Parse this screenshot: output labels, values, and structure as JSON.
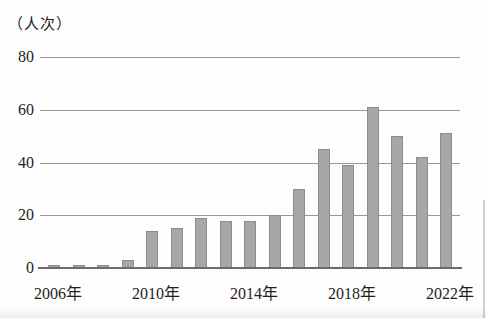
{
  "figure": {
    "unit_label": "（人次）"
  },
  "chart_data": {
    "type": "bar",
    "title": "",
    "xlabel": "",
    "ylabel": "（人次）",
    "x": [
      2006,
      2007,
      2008,
      2009,
      2010,
      2011,
      2012,
      2013,
      2014,
      2015,
      2016,
      2017,
      2018,
      2019,
      2020,
      2021,
      2022
    ],
    "values": [
      1,
      1,
      1,
      3,
      14,
      15,
      19,
      18,
      18,
      20,
      30,
      45,
      39,
      61,
      50,
      42,
      51
    ],
    "ylim": [
      0,
      80
    ],
    "yticks": [
      0,
      20,
      40,
      60,
      80
    ],
    "ytick_labels": [
      "0",
      "20",
      "40",
      "60",
      "80"
    ],
    "x_tick_labels": [
      {
        "index": 0,
        "label": "2006年"
      },
      {
        "index": 4,
        "label": "2010年"
      },
      {
        "index": 8,
        "label": "2014年"
      },
      {
        "index": 12,
        "label": "2018年"
      },
      {
        "index": 16,
        "label": "2022年"
      }
    ],
    "grid": true,
    "legend": false,
    "colors": {
      "bar_fill": "#a7a7a7",
      "bar_border": "#8c8c8c",
      "gridline": "#9a9a9a",
      "axis": "#6b6b6b",
      "text": "#1f1f1f"
    }
  }
}
